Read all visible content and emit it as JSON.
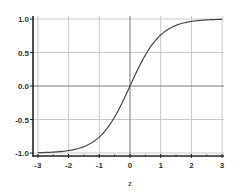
{
  "chart_data": {
    "type": "line",
    "title": "",
    "xlabel": "z",
    "ylabel": "",
    "xlim": [
      -3,
      3
    ],
    "ylim": [
      -1,
      1
    ],
    "grid": true,
    "legend": null,
    "x_ticks": [
      -3,
      -2,
      -1,
      0,
      1,
      2,
      3
    ],
    "x_tick_labels": [
      "-3",
      "-2",
      "-1",
      "0",
      "1",
      "2",
      "3"
    ],
    "x_minor_ticks_step": 0.5,
    "y_ticks": [
      -1.0,
      -0.5,
      0.0,
      0.5,
      1.0
    ],
    "y_tick_labels": [
      "-1.0",
      "-0.5",
      "0.0",
      "0.5",
      "1.0"
    ],
    "series": [
      {
        "name": "tanh(z)",
        "function": "tanh",
        "color": "#444444",
        "x": [
          -3,
          -2.5,
          -2,
          -1.5,
          -1,
          -0.5,
          0,
          0.5,
          1,
          1.5,
          2,
          2.5,
          3
        ],
        "y": [
          -0.995,
          -0.987,
          -0.964,
          -0.905,
          -0.762,
          -0.462,
          0.0,
          0.462,
          0.762,
          0.905,
          0.964,
          0.987,
          0.995
        ]
      }
    ]
  },
  "colors": {
    "grid": "#c8c8c8",
    "axis": "#222222",
    "zero_line": "#777777",
    "curve": "#444444",
    "text": "#333333"
  }
}
